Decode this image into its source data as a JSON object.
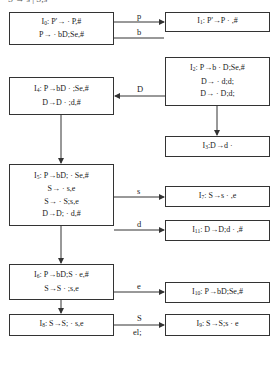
{
  "header": {
    "text": "S → s | S;s"
  },
  "states": [
    {
      "id": "I0",
      "name": "I",
      "index": "0",
      "items": [
        ": P'→ · P,#",
        "P→ · bD;Se,#"
      ]
    },
    {
      "id": "I1",
      "name": "I",
      "index": "1",
      "items": [
        ": P'→P · ,#"
      ]
    },
    {
      "id": "I2",
      "name": "I",
      "index": "2",
      "items": [
        ": P→b · D;Se,#",
        "D→ · d;d;",
        "D→ · D;d;"
      ]
    },
    {
      "id": "I3",
      "name": "I",
      "index": "3",
      "items": [
        ":D→d ·"
      ]
    },
    {
      "id": "I4",
      "name": "I",
      "index": "4",
      "items": [
        ": P→bD · ;Se,#",
        "D→D · ;d,#"
      ]
    },
    {
      "id": "I5",
      "name": "I",
      "index": "5",
      "items": [
        ": P→bD; · Se,#",
        "S→ · s,e",
        "S→ · S;s,e",
        "D→D; · d,#"
      ]
    },
    {
      "id": "I6",
      "name": "I",
      "index": "6",
      "items": [
        ": P→bD;S · e,#",
        "S→S · ;s,e"
      ]
    },
    {
      "id": "I7",
      "name": "I",
      "index": "7",
      "items": [
        ": S→s · ,e"
      ]
    },
    {
      "id": "I8",
      "name": "I",
      "index": "8",
      "items": [
        ": S→S; · s,e"
      ]
    },
    {
      "id": "I9",
      "name": "I",
      "index": "9",
      "items": [
        ": S→S;s · e"
      ]
    },
    {
      "id": "I10",
      "name": "I",
      "index": "10",
      "items": [
        ": P→bD;Se,#"
      ]
    },
    {
      "id": "I11",
      "name": "I",
      "index": "11",
      "items": [
        ": D→D;d · ,#"
      ]
    }
  ],
  "edges": [
    {
      "from": "I0",
      "to": "I1",
      "label": "p"
    },
    {
      "from": "I0",
      "to": "I2",
      "label": "b"
    },
    {
      "from": "I2",
      "to": "I4",
      "label": "D"
    },
    {
      "from": "I2",
      "to": "I3",
      "label": ""
    },
    {
      "from": "I4",
      "to": "I5",
      "label": ""
    },
    {
      "from": "I5",
      "to": "I7",
      "label": "s"
    },
    {
      "from": "I5",
      "to": "I11",
      "label": "d"
    },
    {
      "from": "I5",
      "to": "I6",
      "label": ""
    },
    {
      "from": "I6",
      "to": "I10",
      "label": "e"
    },
    {
      "from": "I6",
      "to": "I8",
      "label": ""
    },
    {
      "from": "I8",
      "to": "I9",
      "label": "S",
      "sublabel": "el;"
    }
  ]
}
